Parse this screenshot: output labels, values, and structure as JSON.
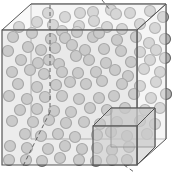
{
  "diagram": {
    "colors": {
      "background": "#ffffff",
      "front_face": "#dcdcdc",
      "side_face": "#f2f2f2",
      "edge": "#555555",
      "particle_fill": "#b4b4b4",
      "particle_stroke": "#6a6a6a",
      "small_cube_face": "#c8c8c8"
    },
    "large_cube": {
      "front": {
        "x": 2,
        "y": 30,
        "w": 135,
        "h": 135
      },
      "offset": {
        "dx": 29,
        "dy": -26
      }
    },
    "small_cube": {
      "front": {
        "x": 93,
        "y": 126,
        "w": 44,
        "h": 39
      },
      "offset": {
        "dx": 18,
        "dy": -18
      }
    },
    "particle_radius": 5.5,
    "particles": [
      [
        48,
        13
      ],
      [
        65,
        17
      ],
      [
        80,
        13
      ],
      [
        93,
        12
      ],
      [
        111,
        10
      ],
      [
        116,
        14
      ],
      [
        130,
        13
      ],
      [
        150,
        11
      ],
      [
        163,
        17
      ],
      [
        19,
        27
      ],
      [
        37,
        22
      ],
      [
        53,
        25
      ],
      [
        79,
        26
      ],
      [
        62,
        31
      ],
      [
        94,
        21
      ],
      [
        107,
        27
      ],
      [
        122,
        29
      ],
      [
        140,
        24
      ],
      [
        155,
        28
      ],
      [
        13,
        37
      ],
      [
        32,
        33
      ],
      [
        51,
        39
      ],
      [
        65,
        38
      ],
      [
        77,
        32
      ],
      [
        93,
        37
      ],
      [
        99,
        33
      ],
      [
        117,
        40
      ],
      [
        136,
        37
      ],
      [
        149,
        43
      ],
      [
        165,
        39
      ],
      [
        8,
        51
      ],
      [
        28,
        47
      ],
      [
        41,
        50
      ],
      [
        55,
        48
      ],
      [
        72,
        45
      ],
      [
        85,
        50
      ],
      [
        104,
        49
      ],
      [
        121,
        51
      ],
      [
        140,
        52
      ],
      [
        156,
        50
      ],
      [
        21,
        60
      ],
      [
        38,
        63
      ],
      [
        49,
        60
      ],
      [
        59,
        64
      ],
      [
        76,
        56
      ],
      [
        89,
        60
      ],
      [
        106,
        63
      ],
      [
        131,
        62
      ],
      [
        150,
        60
      ],
      [
        165,
        58
      ],
      [
        12,
        72
      ],
      [
        30,
        70
      ],
      [
        44,
        74
      ],
      [
        62,
        72
      ],
      [
        78,
        73
      ],
      [
        96,
        72
      ],
      [
        115,
        70
      ],
      [
        128,
        76
      ],
      [
        144,
        69
      ],
      [
        160,
        72
      ],
      [
        18,
        84
      ],
      [
        37,
        87
      ],
      [
        56,
        85
      ],
      [
        70,
        82
      ],
      [
        86,
        84
      ],
      [
        102,
        81
      ],
      [
        122,
        84
      ],
      [
        140,
        86
      ],
      [
        156,
        82
      ],
      [
        9,
        96
      ],
      [
        27,
        99
      ],
      [
        45,
        97
      ],
      [
        62,
        96
      ],
      [
        79,
        99
      ],
      [
        99,
        98
      ],
      [
        114,
        96
      ],
      [
        134,
        94
      ],
      [
        151,
        98
      ],
      [
        166,
        94
      ],
      [
        20,
        110
      ],
      [
        37,
        109
      ],
      [
        54,
        111
      ],
      [
        71,
        112
      ],
      [
        90,
        108
      ],
      [
        107,
        110
      ],
      [
        125,
        108
      ],
      [
        145,
        110
      ],
      [
        160,
        108
      ],
      [
        12,
        121
      ],
      [
        33,
        122
      ],
      [
        49,
        120
      ],
      [
        66,
        123
      ],
      [
        84,
        122
      ],
      [
        100,
        124
      ],
      [
        117,
        122
      ],
      [
        140,
        121
      ],
      [
        155,
        124
      ],
      [
        25,
        134
      ],
      [
        41,
        136
      ],
      [
        58,
        134
      ],
      [
        75,
        137
      ],
      [
        97,
        135
      ],
      [
        111,
        132
      ],
      [
        127,
        136
      ],
      [
        147,
        134
      ],
      [
        10,
        146
      ],
      [
        27,
        148
      ],
      [
        48,
        149
      ],
      [
        65,
        146
      ],
      [
        82,
        149
      ],
      [
        97,
        148
      ],
      [
        112,
        150
      ],
      [
        129,
        147
      ],
      [
        9,
        160
      ],
      [
        26,
        160
      ],
      [
        42,
        161
      ],
      [
        60,
        158
      ],
      [
        79,
        160
      ],
      [
        96,
        161
      ],
      [
        112,
        160
      ],
      [
        127,
        160
      ]
    ],
    "dashed_lines": [
      {
        "from": [
          50,
          5
        ],
        "to": [
          50,
          112
        ]
      },
      {
        "from": [
          50,
          112
        ],
        "to": [
          22,
          168
        ]
      },
      {
        "from": [
          102,
          0
        ],
        "to": [
          110,
          10
        ]
      },
      {
        "from": [
          124,
          165
        ],
        "to": [
          134,
          172
        ]
      }
    ]
  }
}
